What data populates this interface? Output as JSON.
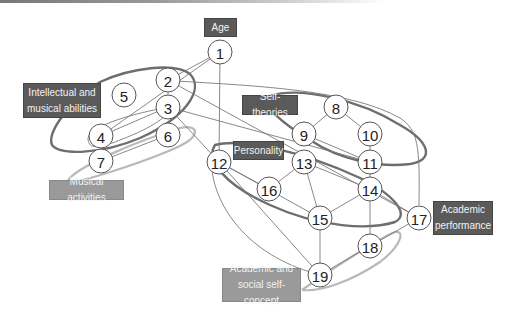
{
  "diagram": {
    "nodes": [
      {
        "id": "1",
        "label": "1",
        "x": 220,
        "y": 52
      },
      {
        "id": "2",
        "label": "2",
        "x": 168,
        "y": 80
      },
      {
        "id": "3",
        "label": "3",
        "x": 168,
        "y": 107
      },
      {
        "id": "4",
        "label": "4",
        "x": 101,
        "y": 136
      },
      {
        "id": "5",
        "label": "5",
        "x": 124,
        "y": 95
      },
      {
        "id": "6",
        "label": "6",
        "x": 168,
        "y": 135
      },
      {
        "id": "7",
        "label": "7",
        "x": 101,
        "y": 161
      },
      {
        "id": "8",
        "label": "8",
        "x": 336,
        "y": 107
      },
      {
        "id": "9",
        "label": "9",
        "x": 304,
        "y": 134
      },
      {
        "id": "10",
        "label": "10",
        "x": 370,
        "y": 134
      },
      {
        "id": "11",
        "label": "11",
        "x": 370,
        "y": 162
      },
      {
        "id": "12",
        "label": "12",
        "x": 219,
        "y": 162
      },
      {
        "id": "13",
        "label": "13",
        "x": 304,
        "y": 162
      },
      {
        "id": "14",
        "label": "14",
        "x": 370,
        "y": 189
      },
      {
        "id": "15",
        "label": "15",
        "x": 320,
        "y": 218
      },
      {
        "id": "16",
        "label": "16",
        "x": 269,
        "y": 189
      },
      {
        "id": "17",
        "label": "17",
        "x": 419,
        "y": 218
      },
      {
        "id": "18",
        "label": "18",
        "x": 370,
        "y": 246
      },
      {
        "id": "19",
        "label": "19",
        "x": 320,
        "y": 275
      }
    ],
    "edges": [
      [
        "1",
        "2"
      ],
      [
        "1",
        "12"
      ],
      [
        "1",
        "4"
      ],
      [
        "2",
        "3"
      ],
      [
        "2",
        "17"
      ],
      [
        "3",
        "4"
      ],
      [
        "3",
        "12"
      ],
      [
        "3",
        "11"
      ],
      [
        "4",
        "7"
      ],
      [
        "6",
        "7"
      ],
      [
        "8",
        "9"
      ],
      [
        "8",
        "10"
      ],
      [
        "9",
        "11"
      ],
      [
        "10",
        "11"
      ],
      [
        "11",
        "14"
      ],
      [
        "12",
        "16"
      ],
      [
        "12",
        "15"
      ],
      [
        "12",
        "19"
      ],
      [
        "13",
        "16"
      ],
      [
        "13",
        "14"
      ],
      [
        "13",
        "15"
      ],
      [
        "14",
        "15"
      ],
      [
        "14",
        "17"
      ],
      [
        "14",
        "18"
      ],
      [
        "15",
        "19"
      ],
      [
        "17",
        "18"
      ],
      [
        "18",
        "19"
      ]
    ],
    "groups": [
      {
        "label": "Age",
        "style": "dark"
      },
      {
        "label": "Intellectual and musical abilities",
        "style": "dark"
      },
      {
        "label": "Self-theories",
        "style": "dark"
      },
      {
        "label": "Personality",
        "style": "dark"
      },
      {
        "label": "Musical activities",
        "style": "light"
      },
      {
        "label": "Academic performance",
        "style": "dark"
      },
      {
        "label": "Academic and social self-concept",
        "style": "light"
      }
    ]
  },
  "labels": {
    "age": "Age",
    "intellectual_line1": "Intellectual and",
    "intellectual_line2": "musical abilities",
    "self_theories": "Self-theories",
    "personality": "Personality",
    "musical_activities": "Musical activities",
    "academic_perf_line1": "Academic",
    "academic_perf_line2": "performance",
    "self_concept_line1": "Academic and",
    "self_concept_line2": "social self-concept"
  },
  "colors": {
    "dark_label": "#5a5a5a",
    "light_label": "#9a9a9a",
    "dark_outline": "#6e6e6e",
    "light_outline": "#b9b9b9",
    "edge": "#7a7a7a"
  }
}
